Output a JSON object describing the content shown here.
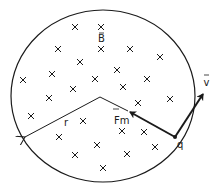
{
  "diagram": {
    "field_label": "B",
    "radius_label": "r",
    "force_label": "Fm",
    "velocity_label": "v",
    "charge_label": "q",
    "field_symbol": "×",
    "colors": {
      "ink": "#1a1a1a",
      "background": "#ffffff"
    },
    "crosses": [
      [
        75,
        27
      ],
      [
        101,
        27
      ],
      [
        58,
        49
      ],
      [
        101,
        49
      ],
      [
        130,
        49
      ],
      [
        160,
        57
      ],
      [
        80,
        62
      ],
      [
        117,
        70
      ],
      [
        52,
        74
      ],
      [
        23,
        80
      ],
      [
        95,
        79
      ],
      [
        147,
        79
      ],
      [
        73,
        89
      ],
      [
        123,
        87
      ],
      [
        49,
        98
      ],
      [
        138,
        103
      ],
      [
        170,
        99
      ],
      [
        31,
        116
      ],
      [
        83,
        121
      ],
      [
        122,
        131
      ],
      [
        144,
        132
      ],
      [
        59,
        137
      ],
      [
        97,
        145
      ],
      [
        155,
        147
      ],
      [
        75,
        155
      ],
      [
        127,
        154
      ],
      [
        103,
        168
      ]
    ]
  }
}
